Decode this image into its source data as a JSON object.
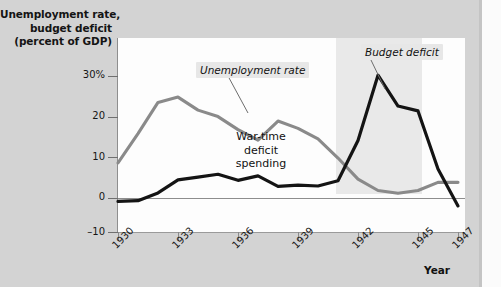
{
  "chart_data": {
    "type": "line",
    "title": "",
    "ylabel": "Unemployment rate, budget deficit (percent of GDP)",
    "ylabel_lines": [
      "Unemployment rate,",
      "budget deficit",
      "(percent of GDP)"
    ],
    "xlabel": "Year",
    "ylim": [
      -10,
      34
    ],
    "xlim": [
      1930,
      1947.5
    ],
    "ytick_labels": [
      "30%",
      "20",
      "10",
      "0",
      "–10"
    ],
    "ytick_values": [
      30,
      20,
      10,
      0,
      -10
    ],
    "xtick_labels": [
      "1930",
      "1933",
      "1936",
      "1939",
      "1942",
      "1945",
      "1947"
    ],
    "xtick_values": [
      1930,
      1933,
      1936,
      1939,
      1942,
      1945,
      1947
    ],
    "grid": false,
    "legend": "none",
    "zero_line": true,
    "x": [
      1930,
      1931,
      1932,
      1933,
      1934,
      1935,
      1936,
      1937,
      1938,
      1939,
      1940,
      1941,
      1942,
      1943,
      1944,
      1945,
      1946,
      1947
    ],
    "series": [
      {
        "name": "Unemployment rate",
        "color": "#8a8a8a",
        "values": [
          8.7,
          15.9,
          23.6,
          24.9,
          21.7,
          20.1,
          16.9,
          14.3,
          19.0,
          17.2,
          14.6,
          9.9,
          4.7,
          1.9,
          1.2,
          1.9,
          3.9,
          3.9
        ]
      },
      {
        "name": "Budget deficit",
        "color": "#141414",
        "values": [
          -0.8,
          -0.6,
          1.3,
          4.5,
          5.2,
          5.9,
          4.4,
          5.5,
          2.9,
          3.2,
          3.0,
          4.3,
          14.2,
          30.3,
          22.7,
          21.5,
          7.2,
          -1.9
        ]
      }
    ],
    "annotations": [
      {
        "name": "unemployment-callout",
        "text": "Unemployment rate"
      },
      {
        "name": "deficit-callout",
        "text": "Budget deficit"
      },
      {
        "name": "war-band-label",
        "text": "War-time deficit spending",
        "lines": [
          "War-time",
          "deficit",
          "spending"
        ]
      }
    ],
    "shaded_region": {
      "label": "War-time deficit spending",
      "start": 1935,
      "end": 1939.3,
      "color": "#e9e9e9"
    }
  }
}
